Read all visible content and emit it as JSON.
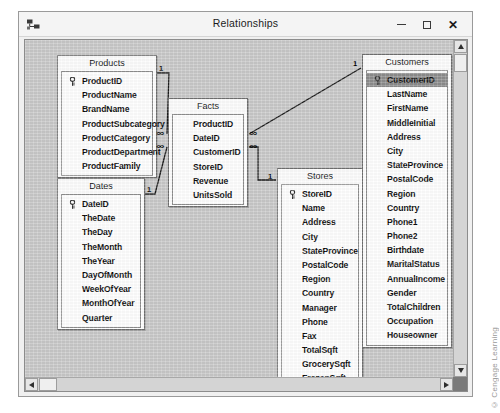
{
  "window": {
    "title": "Relationships",
    "icon": "relationships-icon",
    "buttons": {
      "minimize": "minimize-button",
      "maximize": "maximize-button",
      "close": "close-button"
    }
  },
  "watermark": "© Cengage Learning",
  "scrollbars": {
    "vertical": {
      "up": "scroll-up-arrow",
      "down": "scroll-down-arrow"
    },
    "horizontal": {
      "left": "scroll-left-arrow",
      "right": "scroll-right-arrow"
    }
  },
  "tables": [
    {
      "name": "Products",
      "x": 32,
      "y": 15,
      "w": 100,
      "fields": [
        {
          "label": "ProductID",
          "key": true
        },
        {
          "label": "ProductName",
          "key": false
        },
        {
          "label": "BrandName",
          "key": false
        },
        {
          "label": "ProductSubcategory",
          "key": false
        },
        {
          "label": "ProductCategory",
          "key": false
        },
        {
          "label": "ProductDepartment",
          "key": false
        },
        {
          "label": "ProductFamily",
          "key": false
        }
      ]
    },
    {
      "name": "Dates",
      "x": 32,
      "y": 138,
      "w": 88,
      "fields": [
        {
          "label": "DateID",
          "key": true
        },
        {
          "label": "TheDate",
          "key": false
        },
        {
          "label": "TheDay",
          "key": false
        },
        {
          "label": "TheMonth",
          "key": false
        },
        {
          "label": "TheYear",
          "key": false
        },
        {
          "label": "DayOfMonth",
          "key": false
        },
        {
          "label": "WeekOfYear",
          "key": false
        },
        {
          "label": "MonthOfYear",
          "key": false
        },
        {
          "label": "Quarter",
          "key": false
        }
      ]
    },
    {
      "name": "Facts",
      "x": 143,
      "y": 58,
      "w": 80,
      "fields": [
        {
          "label": "ProductID",
          "key": false
        },
        {
          "label": "DateID",
          "key": false
        },
        {
          "label": "CustomerID",
          "key": false
        },
        {
          "label": "StoreID",
          "key": false
        },
        {
          "label": "Revenue",
          "key": false
        },
        {
          "label": "UnitsSold",
          "key": false
        }
      ]
    },
    {
      "name": "Stores",
      "x": 252,
      "y": 128,
      "w": 86,
      "fields": [
        {
          "label": "StoreID",
          "key": true
        },
        {
          "label": "Name",
          "key": false
        },
        {
          "label": "Address",
          "key": false
        },
        {
          "label": "City",
          "key": false
        },
        {
          "label": "StateProvince",
          "key": false
        },
        {
          "label": "PostalCode",
          "key": false
        },
        {
          "label": "Region",
          "key": false
        },
        {
          "label": "Country",
          "key": false
        },
        {
          "label": "Manager",
          "key": false
        },
        {
          "label": "Phone",
          "key": false
        },
        {
          "label": "Fax",
          "key": false
        },
        {
          "label": "TotalSqft",
          "key": false
        },
        {
          "label": "GrocerySqft",
          "key": false
        },
        {
          "label": "FrozenSqft",
          "key": false
        },
        {
          "label": "MeatSqft",
          "key": false
        }
      ]
    },
    {
      "name": "Customers",
      "x": 337,
      "y": 14,
      "w": 90,
      "fields": [
        {
          "label": "CustomerID",
          "key": true,
          "selected": true
        },
        {
          "label": "LastName",
          "key": false
        },
        {
          "label": "FirstName",
          "key": false
        },
        {
          "label": "MiddleInitial",
          "key": false
        },
        {
          "label": "Address",
          "key": false
        },
        {
          "label": "City",
          "key": false
        },
        {
          "label": "StateProvince",
          "key": false
        },
        {
          "label": "PostalCode",
          "key": false
        },
        {
          "label": "Region",
          "key": false
        },
        {
          "label": "Country",
          "key": false
        },
        {
          "label": "Phone1",
          "key": false
        },
        {
          "label": "Phone2",
          "key": false
        },
        {
          "label": "Birthdate",
          "key": false
        },
        {
          "label": "MaritalStatus",
          "key": false
        },
        {
          "label": "AnnualIncome",
          "key": false
        },
        {
          "label": "Gender",
          "key": false
        },
        {
          "label": "TotalChildren",
          "key": false
        },
        {
          "label": "Occupation",
          "key": false
        },
        {
          "label": "Houseowner",
          "key": false
        }
      ]
    }
  ],
  "relationships": [
    {
      "name": "products-to-facts",
      "from": "Products",
      "to": "Facts",
      "one": "1",
      "many": "∞"
    },
    {
      "name": "dates-to-facts",
      "from": "Dates",
      "to": "Facts",
      "one": "1",
      "many": "∞"
    },
    {
      "name": "customers-to-facts",
      "from": "Customers",
      "to": "Facts",
      "one": "1",
      "many": "∞"
    },
    {
      "name": "stores-to-facts",
      "from": "Stores",
      "to": "Facts",
      "one": "1",
      "many": "∞"
    }
  ]
}
